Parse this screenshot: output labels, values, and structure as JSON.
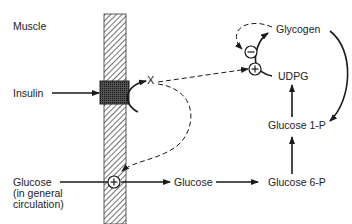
{
  "labels": {
    "compartment": "Muscle",
    "insulin": "Insulin",
    "glucose_circ_line1": "Glucose",
    "glucose_circ_line2": "(in general",
    "glucose_circ_line3": "circulation)",
    "glucose": "Glucose",
    "glucose6p": "Glucose 6-P",
    "glucose1p": "Glucose 1-P",
    "udpg": "UDPG",
    "glycogen": "Glycogen",
    "mediator": "X"
  },
  "symbols": {
    "stimulate": "+",
    "inhibit": "−"
  },
  "colors": {
    "ink": "#1a1a1a",
    "background": "#ffffff"
  }
}
